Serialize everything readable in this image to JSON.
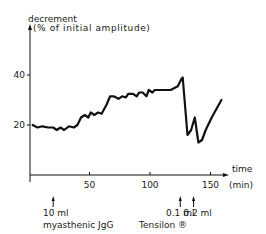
{
  "chart_data": {
    "type": "line",
    "title": "",
    "ylabel_line1": "decrement",
    "ylabel_line2": "(% of initial amplitude)",
    "xlabel_line1": "time",
    "xlabel_line2": "(min)",
    "xlim": [
      0,
      165
    ],
    "ylim": [
      0,
      52
    ],
    "x_ticks": [
      50,
      100,
      150
    ],
    "x_tick_labels": [
      "50",
      "100",
      "150"
    ],
    "y_ticks": [
      20,
      40
    ],
    "y_tick_labels": [
      "20",
      "40"
    ],
    "grid": false,
    "legend": "none",
    "series": [
      {
        "name": "decrement",
        "x": [
          3,
          7,
          11,
          16,
          20,
          23,
          26,
          29,
          33,
          37,
          40,
          43,
          46,
          49,
          51,
          54,
          57,
          60,
          64,
          67,
          70,
          74,
          77,
          80,
          82,
          86,
          89,
          91,
          94,
          97,
          99,
          102,
          104,
          117,
          123,
          126,
          127,
          131,
          134,
          137,
          140,
          143,
          146,
          151,
          159
        ],
        "y": [
          20,
          19,
          19.5,
          19,
          19,
          18,
          19,
          18,
          19.5,
          19,
          20,
          23,
          24,
          23,
          25,
          24,
          25,
          24.5,
          28,
          31.5,
          31.5,
          30.5,
          31.5,
          31,
          32.5,
          32.5,
          31.5,
          33,
          33,
          31.5,
          34,
          33,
          34,
          34,
          35.5,
          38.5,
          39,
          16,
          18,
          23,
          13,
          14,
          18,
          23,
          30
        ]
      }
    ],
    "annotations": [
      {
        "x": 20,
        "line1": "10 ml",
        "line2": "myasthenic  JgG"
      },
      {
        "x": 125,
        "line1": "0.1 ml",
        "line2": ""
      },
      {
        "x": 136,
        "line1": "0.2 ml",
        "line2": ""
      },
      {
        "x": 130,
        "line1": "",
        "line2": "Tensilon ®"
      }
    ]
  }
}
